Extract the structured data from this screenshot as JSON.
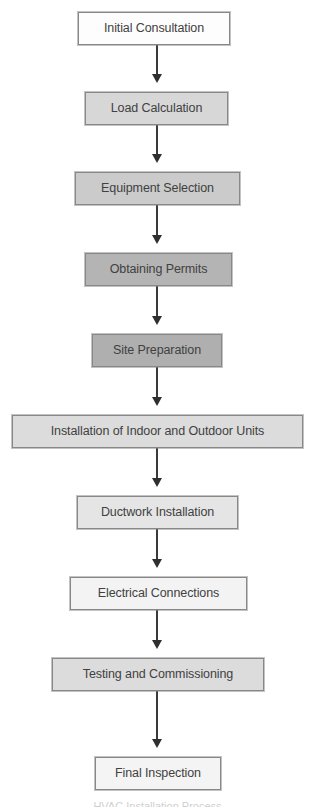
{
  "diagram": {
    "type": "vertical-flowchart",
    "orientation": "top-to-bottom",
    "canvas": {
      "width": 315,
      "height": 808,
      "background": "#ffffff"
    },
    "edge_style": {
      "line_color": "#3a3a3a",
      "line_width": 2,
      "arrowhead": "solid-triangle",
      "arrowhead_color": "#2f2f2f"
    },
    "node_style": {
      "border_color": "#888888",
      "text_color": "#414141",
      "shape": "rectangle"
    },
    "nodes": [
      {
        "id": "initial-consultation",
        "label": "Initial Consultation",
        "fill": "#fdfdfd",
        "x": 78,
        "y": 12,
        "w": 152,
        "h": 33
      },
      {
        "id": "load-calculation",
        "label": "Load Calculation",
        "fill": "#d7d7d7",
        "x": 85,
        "y": 92,
        "w": 143,
        "h": 33
      },
      {
        "id": "equipment-selection",
        "label": "Equipment Selection",
        "fill": "#cbcbcb",
        "x": 75,
        "y": 172,
        "w": 165,
        "h": 33
      },
      {
        "id": "obtaining-permits",
        "label": "Obtaining Permits",
        "fill": "#b4b4b4",
        "x": 85,
        "y": 253,
        "w": 147,
        "h": 33
      },
      {
        "id": "site-preparation",
        "label": "Site Preparation",
        "fill": "#afafaf",
        "x": 92,
        "y": 334,
        "w": 130,
        "h": 33
      },
      {
        "id": "installation-indoor-outdoor-units",
        "label": "Installation of Indoor and Outdoor Units",
        "fill": "#dcdcdc",
        "x": 12,
        "y": 415,
        "w": 291,
        "h": 33
      },
      {
        "id": "ductwork-installation",
        "label": "Ductwork Installation",
        "fill": "#e5e5e5",
        "x": 77,
        "y": 496,
        "w": 161,
        "h": 33
      },
      {
        "id": "electrical-connections",
        "label": "Electrical Connections",
        "fill": "#f3f3f3",
        "x": 70,
        "y": 577,
        "w": 177,
        "h": 33
      },
      {
        "id": "testing-and-commissioning",
        "label": "Testing and Commissioning",
        "fill": "#dcdcdc",
        "x": 52,
        "y": 658,
        "w": 212,
        "h": 33
      },
      {
        "id": "final-inspection",
        "label": "Final Inspection",
        "fill": "#f4f4f4",
        "x": 95,
        "y": 757,
        "w": 126,
        "h": 33
      }
    ],
    "edges": [
      {
        "id": "edge-1",
        "from": "initial-consultation",
        "to": "load-calculation",
        "y": 45,
        "length": 38
      },
      {
        "id": "edge-2",
        "from": "load-calculation",
        "to": "equipment-selection",
        "y": 125,
        "length": 38
      },
      {
        "id": "edge-3",
        "from": "equipment-selection",
        "to": "obtaining-permits",
        "y": 205,
        "length": 39
      },
      {
        "id": "edge-4",
        "from": "obtaining-permits",
        "to": "site-preparation",
        "y": 286,
        "length": 39
      },
      {
        "id": "edge-5",
        "from": "site-preparation",
        "to": "installation-indoor-outdoor-units",
        "y": 367,
        "length": 39
      },
      {
        "id": "edge-6",
        "from": "installation-indoor-outdoor-units",
        "to": "ductwork-installation",
        "y": 448,
        "length": 39
      },
      {
        "id": "edge-7",
        "from": "ductwork-installation",
        "to": "electrical-connections",
        "y": 529,
        "length": 39
      },
      {
        "id": "edge-8",
        "from": "electrical-connections",
        "to": "testing-and-commissioning",
        "y": 610,
        "length": 39
      },
      {
        "id": "edge-9",
        "from": "testing-and-commissioning",
        "to": "final-inspection",
        "y": 691,
        "length": 57
      }
    ],
    "caption": {
      "visible_sliver": "HVAC Installation Process",
      "y": 801
    }
  }
}
